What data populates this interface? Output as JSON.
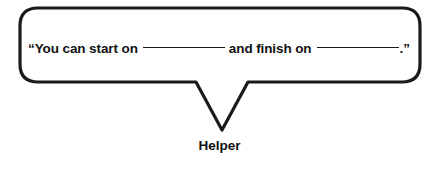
{
  "figure": {
    "type": "speech-bubble-diagram",
    "background_color": "#ffffff",
    "outline_color": "#1a1a1a",
    "text_color": "#111111"
  },
  "bubble": {
    "open_quote": "“",
    "text_before_blank1": "You can start on",
    "blank1": "________",
    "text_between_blanks": "and finish on",
    "blank2": "________",
    "end_punctuation": ".",
    "close_quote": "”",
    "full_text": "“You can start on ________ and finish on ________.”"
  },
  "caption": {
    "label": "Helper"
  }
}
